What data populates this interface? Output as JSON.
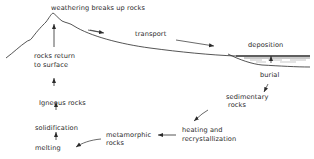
{
  "diagram": {
    "labels": {
      "weathering": "weathering breaks up rocks",
      "transport": "transport",
      "deposition": "deposition",
      "burial": "burial",
      "sedimentary_1": "sedimentary",
      "sedimentary_2": "rocks",
      "heating_1": "heating and",
      "heating_2": "recrystallization",
      "metamorphic_1": "metamorphic",
      "metamorphic_2": "rocks",
      "melting": "melting",
      "solidification": "solidification",
      "igneous": "Igneous rocks",
      "return_1": "rocks return",
      "return_2": "to surface"
    },
    "colors": {
      "ink": "#2a2a2a",
      "background": "#ffffff"
    }
  }
}
